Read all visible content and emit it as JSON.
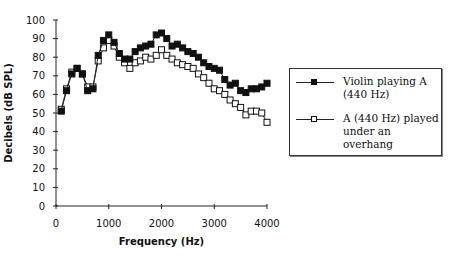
{
  "chart_data": {
    "type": "line",
    "title": "",
    "xlabel": "Frequency (Hz)",
    "ylabel": "Decibels (dB SPL)",
    "xlim": [
      0,
      4000
    ],
    "ylim": [
      0,
      100
    ],
    "x_ticks": [
      "0",
      "1000",
      "2000",
      "3000",
      "4000"
    ],
    "y_ticks": [
      "0",
      "10",
      "20",
      "30",
      "40",
      "50",
      "60",
      "70",
      "80",
      "90",
      "100"
    ],
    "grid": false,
    "legend_position": "right",
    "x": [
      100,
      200,
      300,
      400,
      500,
      600,
      700,
      800,
      900,
      1000,
      1100,
      1200,
      1300,
      1400,
      1500,
      1600,
      1700,
      1800,
      1900,
      2000,
      2100,
      2200,
      2300,
      2400,
      2500,
      2600,
      2700,
      2800,
      2900,
      3000,
      3100,
      3200,
      3300,
      3400,
      3500,
      3600,
      3700,
      3800,
      3900,
      4000
    ],
    "series": [
      {
        "name": "Violin playing A (440 Hz)",
        "marker": "filled-square",
        "values": [
          51,
          62,
          71,
          74,
          71,
          62,
          63,
          81,
          89,
          92,
          88,
          82,
          79,
          79,
          83,
          85,
          86,
          87,
          92,
          93,
          90,
          86,
          87,
          85,
          83,
          82,
          80,
          77,
          75,
          74,
          73,
          68,
          65,
          66,
          62,
          61,
          63,
          63,
          64,
          66
        ]
      },
      {
        "name": "A (440 Hz) played under an overhang",
        "marker": "open-square",
        "values": [
          52,
          63,
          72,
          74,
          71,
          64,
          64,
          78,
          85,
          89,
          86,
          80,
          77,
          74,
          77,
          78,
          80,
          79,
          81,
          84,
          81,
          79,
          77,
          76,
          75,
          74,
          71,
          69,
          66,
          63,
          62,
          60,
          57,
          55,
          53,
          49,
          51,
          51,
          50,
          45
        ]
      }
    ]
  },
  "legend": {
    "items": [
      {
        "lines": [
          "Violin playing A",
          "(440 Hz)"
        ]
      },
      {
        "lines": [
          "A (440 Hz) played",
          "under an",
          "overhang"
        ]
      }
    ]
  }
}
